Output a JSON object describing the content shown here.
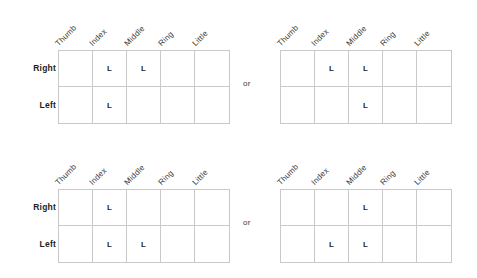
{
  "figure": {
    "connector_label": "or",
    "columns": [
      "Thumb",
      "Index",
      "Middle",
      "Ring",
      "Little"
    ],
    "rows": [
      "Right",
      "Left"
    ],
    "mark": "L",
    "colors": {
      "text": "#231f20",
      "muted_text": "#3a3a3a",
      "grid_line": "#c9c9c9",
      "background": "#ffffff"
    }
  },
  "blocks": [
    {
      "name": "top-block",
      "options": [
        {
          "name": "top-left-option",
          "marks": [
            [
              "",
              "L",
              "L",
              "",
              ""
            ],
            [
              "",
              "L",
              "",
              "",
              ""
            ]
          ]
        },
        {
          "name": "top-right-option",
          "marks": [
            [
              "",
              "L",
              "L",
              "",
              ""
            ],
            [
              "",
              "",
              "L",
              "",
              ""
            ]
          ]
        }
      ]
    },
    {
      "name": "bottom-block",
      "options": [
        {
          "name": "bottom-left-option",
          "marks": [
            [
              "",
              "L",
              "",
              "",
              ""
            ],
            [
              "",
              "L",
              "L",
              "",
              ""
            ]
          ]
        },
        {
          "name": "bottom-right-option",
          "marks": [
            [
              "",
              "",
              "L",
              "",
              ""
            ],
            [
              "",
              "L",
              "L",
              "",
              ""
            ]
          ]
        }
      ]
    }
  ]
}
